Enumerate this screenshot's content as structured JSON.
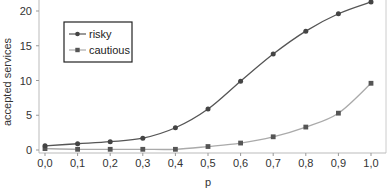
{
  "chart_data": {
    "type": "line",
    "title": "",
    "xlabel": "p",
    "ylabel": "accepted services",
    "x": [
      0.0,
      0.1,
      0.2,
      0.3,
      0.4,
      0.5,
      0.6,
      0.7,
      0.8,
      0.9,
      1.0
    ],
    "x_tick_labels": [
      "0,0",
      "0,1",
      "0,2",
      "0,3",
      "0,4",
      "0,5",
      "0,6",
      "0,7",
      "0,8",
      "0,9",
      "1,0"
    ],
    "y_ticks": [
      0,
      5,
      10,
      15,
      20
    ],
    "ylim": [
      0,
      21.5
    ],
    "grid": false,
    "legend_position": "upper-left",
    "series": [
      {
        "name": "risky",
        "marker": "circle",
        "color": "#555555",
        "values": [
          0.6,
          0.9,
          1.2,
          1.7,
          3.2,
          5.9,
          9.9,
          13.8,
          17.1,
          19.6,
          21.3
        ]
      },
      {
        "name": "cautious",
        "marker": "square",
        "color": "#aaaaaa",
        "marker_color": "#555555",
        "values": [
          0.2,
          0.1,
          0.1,
          0.1,
          0.1,
          0.5,
          1.0,
          1.9,
          3.3,
          5.3,
          9.6
        ]
      }
    ]
  }
}
